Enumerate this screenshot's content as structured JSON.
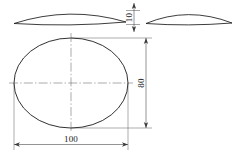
{
  "drawing": {
    "title": "Elliptical dished plate - orthographic views",
    "background_color": "#ffffff",
    "line_color": "#1a1a1a",
    "centerline_color": "#555555",
    "dimension_color": "#4a4a4a",
    "views": [
      {
        "name": "front-elevation",
        "type": "lens-profile",
        "description": "shallow dome / lens profile, front view"
      },
      {
        "name": "side-elevation",
        "type": "lens-profile",
        "description": "shallow dome / lens profile, side view"
      },
      {
        "name": "plan-view",
        "type": "ellipse",
        "description": "elliptical outline with horizontal and vertical centerlines"
      }
    ],
    "dimensions": [
      {
        "name": "thickness",
        "label": "10",
        "orientation": "vertical",
        "applies_to": "front-elevation"
      },
      {
        "name": "minor-axis",
        "label": "80",
        "orientation": "vertical",
        "applies_to": "plan-view"
      },
      {
        "name": "major-axis",
        "label": "100",
        "orientation": "horizontal",
        "applies_to": "plan-view"
      }
    ]
  },
  "labels": {
    "thickness": "10",
    "height": "80",
    "width": "100"
  }
}
